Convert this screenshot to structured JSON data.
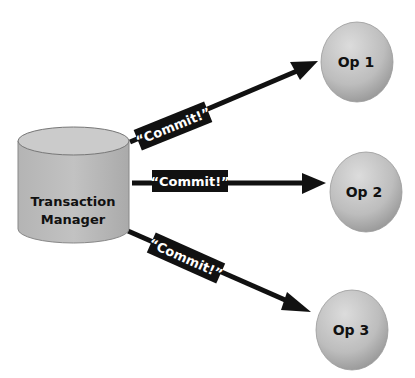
{
  "diagram": {
    "source": {
      "shape": "cylinder",
      "label_line1": "Transaction",
      "label_line2": "Manager"
    },
    "targets": [
      {
        "label": "Op 1",
        "shape": "circle"
      },
      {
        "label": "Op 2",
        "shape": "circle"
      },
      {
        "label": "Op 3",
        "shape": "circle"
      }
    ],
    "edges": [
      {
        "from": "Transaction Manager",
        "to": "Op 1",
        "label": "“Commit!”"
      },
      {
        "from": "Transaction Manager",
        "to": "Op 2",
        "label": "“Commit!”"
      },
      {
        "from": "Transaction Manager",
        "to": "Op 3",
        "label": "“Commit!”"
      }
    ]
  },
  "colors": {
    "node_fill_light": "#d0d0d0",
    "node_fill_dark": "#9a9a9a",
    "arrow": "#111111",
    "label_bg": "#111111",
    "label_text": "#ffffff"
  }
}
